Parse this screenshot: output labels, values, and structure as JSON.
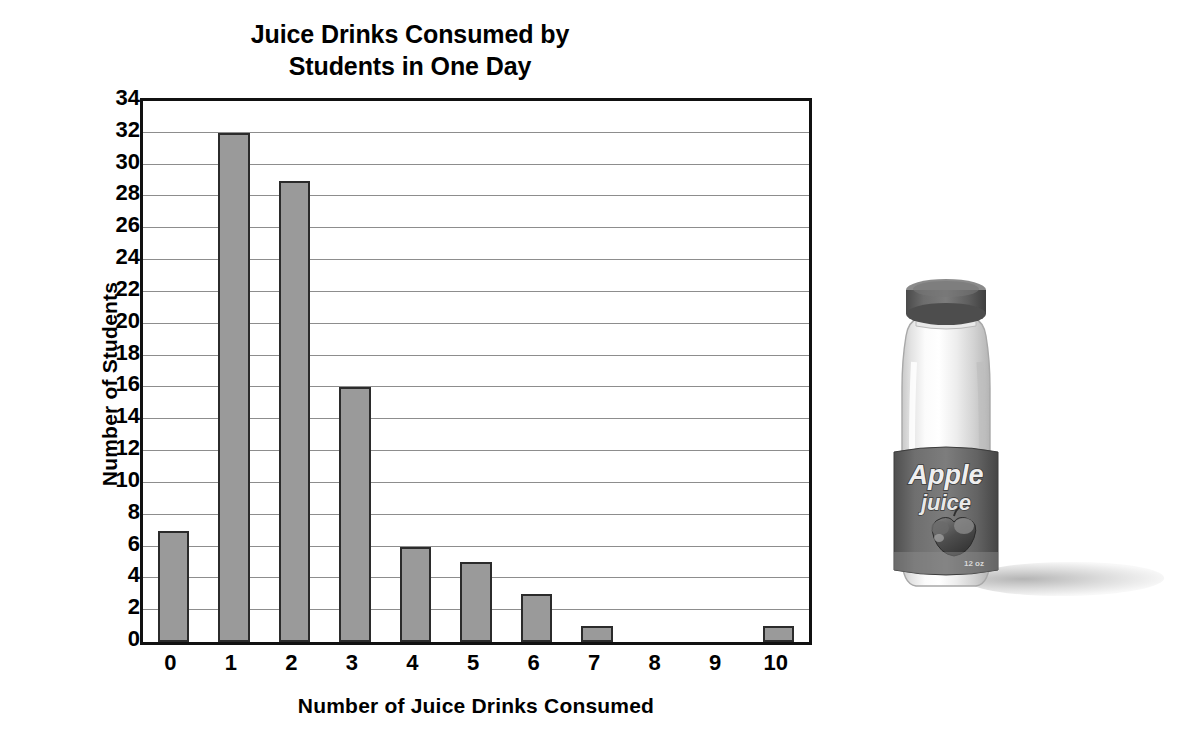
{
  "chart_data": {
    "type": "bar",
    "title": "Juice Drinks Consumed by\nStudents in One Day",
    "xlabel": "Number of Juice Drinks Consumed",
    "ylabel": "Number of Students",
    "categories": [
      "0",
      "1",
      "2",
      "3",
      "4",
      "5",
      "6",
      "7",
      "8",
      "9",
      "10"
    ],
    "values": [
      7,
      32,
      29,
      16,
      6,
      5,
      3,
      1,
      0,
      0,
      1
    ],
    "ylim": [
      0,
      34
    ],
    "ytick_step": 2,
    "yticks": [
      0,
      2,
      4,
      6,
      8,
      10,
      12,
      14,
      16,
      18,
      20,
      22,
      24,
      26,
      28,
      30,
      32,
      34
    ],
    "grid": true,
    "grid_axis": "y",
    "legend": null,
    "bar_color": "#9a9a9a",
    "bar_edge_color": "#2b2b2b",
    "gridline_color": "#8d8d8d",
    "axis_color": "#111111",
    "background_color": "#ffffff"
  },
  "illustration": {
    "name": "apple-juice-bottle",
    "label_line1": "Apple",
    "label_line2": "juice",
    "label_volume": "12 oz",
    "cap_color": "#5f5f5f",
    "label_color": "#6e6e6e",
    "bottle_color": "#e6e6e6",
    "shadow_color": "#9a9a9a"
  }
}
